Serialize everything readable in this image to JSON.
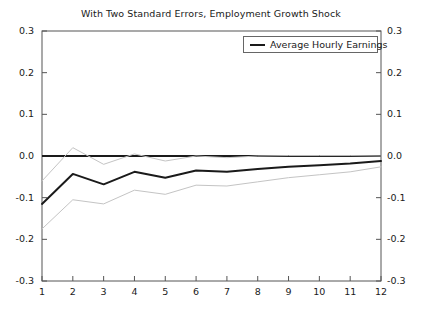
{
  "chart_data": {
    "type": "line",
    "title": "With Two Standard Errors, Employment Growth Shock",
    "xlabel": "",
    "ylabel": "",
    "x": [
      1,
      2,
      3,
      4,
      5,
      6,
      7,
      8,
      9,
      10,
      11,
      12
    ],
    "xlim": [
      1,
      12
    ],
    "ylim": [
      -0.3,
      0.3
    ],
    "xticks": [
      "1",
      "2",
      "3",
      "4",
      "5",
      "6",
      "7",
      "8",
      "9",
      "10",
      "11",
      "12"
    ],
    "yticks": [
      "0.3",
      "0.2",
      "0.1",
      "0.0",
      "-0.1",
      "-0.2",
      "-0.3"
    ],
    "ytick_values": [
      0.3,
      0.2,
      0.1,
      0.0,
      -0.1,
      -0.2,
      -0.3
    ],
    "grid": false,
    "legend_position": "top-right",
    "zero_line": 0.0,
    "dual_y_axis": true,
    "series": [
      {
        "name": "Average Hourly Earnings",
        "style": "solid",
        "color": "#1a1a1a",
        "width": 2,
        "values": [
          -0.115,
          -0.043,
          -0.068,
          -0.038,
          -0.052,
          -0.035,
          -0.038,
          -0.031,
          -0.026,
          -0.022,
          -0.018,
          -0.012
        ]
      },
      {
        "name": "Upper Two Standard Errors",
        "style": "solid",
        "color": "#c4c4c4",
        "width": 1,
        "values": [
          -0.06,
          0.02,
          -0.02,
          0.005,
          -0.012,
          0.0,
          -0.004,
          0.0,
          0.001,
          0.001,
          0.001,
          0.0
        ]
      },
      {
        "name": "Lower Two Standard Errors",
        "style": "solid",
        "color": "#c4c4c4",
        "width": 1,
        "values": [
          -0.175,
          -0.105,
          -0.115,
          -0.082,
          -0.092,
          -0.07,
          -0.072,
          -0.062,
          -0.052,
          -0.045,
          -0.038,
          -0.026
        ]
      }
    ]
  },
  "legend": {
    "entries": [
      {
        "label": "Average Hourly Earnings"
      }
    ]
  },
  "axes": {
    "left_labels": [
      "0.3",
      "0.2",
      "0.1",
      "0.0",
      "-0.1",
      "-0.2",
      "-0.3"
    ],
    "right_labels": [
      "0.3",
      "0.2",
      "0.1",
      "0.0",
      "-0.1",
      "-0.2",
      "-0.3"
    ],
    "bottom_labels": [
      "1",
      "2",
      "3",
      "4",
      "5",
      "6",
      "7",
      "8",
      "9",
      "10",
      "11",
      "12"
    ]
  },
  "colors": {
    "axis": "#555555",
    "series_main": "#1a1a1a",
    "series_band": "#c4c4c4",
    "zero_line": "#1a1a1a",
    "background": "#ffffff"
  }
}
